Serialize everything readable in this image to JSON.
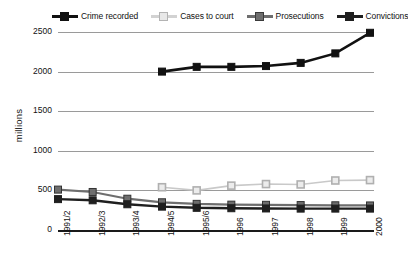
{
  "chart_data": {
    "type": "line",
    "title": "",
    "xlabel": "",
    "ylabel": "millions",
    "categories": [
      "1991/2",
      "1992/3",
      "1993/4",
      "1994/5",
      "1995/6",
      "1996",
      "1997",
      "1998",
      "1999",
      "2000"
    ],
    "ylim": [
      0,
      2500
    ],
    "yticks": [
      0,
      500,
      1000,
      1500,
      2000,
      2500
    ],
    "grid": true,
    "legend_position": "top",
    "series": [
      {
        "name": "Crime recorded",
        "color": "#111111",
        "marker": "filled-square",
        "values": [
          null,
          null,
          null,
          2000,
          2060,
          2060,
          2070,
          2110,
          2230,
          2490
        ]
      },
      {
        "name": "Cases to court",
        "color": "#c9c9c9",
        "marker": "open-square",
        "values": [
          null,
          null,
          null,
          540,
          500,
          560,
          580,
          575,
          625,
          630
        ]
      },
      {
        "name": "Prosecutions",
        "color": "#6e6e6e",
        "marker": "filled-square",
        "values": [
          510,
          480,
          395,
          350,
          330,
          320,
          318,
          315,
          312,
          310
        ]
      },
      {
        "name": "Convictions",
        "color": "#1f1f1f",
        "marker": "filled-square",
        "values": [
          390,
          375,
          325,
          295,
          280,
          275,
          272,
          270,
          270,
          270
        ]
      }
    ]
  },
  "axis": {
    "y_label": "millions",
    "y_ticks": [
      "0",
      "500",
      "1000",
      "1500",
      "2000",
      "2500"
    ],
    "x_ticks": [
      "1991/2",
      "1992/3",
      "1993/4",
      "1994/5",
      "1995/6",
      "1996",
      "1997",
      "1998",
      "1999",
      "2000"
    ]
  },
  "legend": {
    "items": [
      {
        "label": "Crime recorded",
        "icon": "filled-square-marker"
      },
      {
        "label": "Cases to court",
        "icon": "open-square-marker"
      },
      {
        "label": "Prosecutions",
        "icon": "filled-square-marker"
      },
      {
        "label": "Convictions",
        "icon": "filled-square-marker"
      }
    ]
  }
}
